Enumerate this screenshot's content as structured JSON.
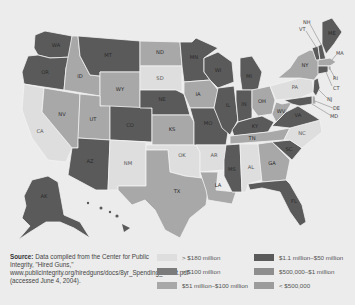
{
  "map": {
    "title": "",
    "colors": {
      "gt180": "#dedede",
      "gt100": "#7b7b7b",
      "m51_100": "#a8a8a8",
      "m1_50": "#5a5a5a",
      "k500_1m": "#8e8e8e",
      "lt500k": "#9c9c9c"
    },
    "states": [
      {
        "abbr": "WA",
        "category": "$1.1 million–$50 million"
      },
      {
        "abbr": "OR",
        "category": "$1.1 million–$50 million"
      },
      {
        "abbr": "CA",
        "category": "> $180 million"
      },
      {
        "abbr": "ID",
        "category": "$51 million–$100 million"
      },
      {
        "abbr": "NV",
        "category": "$51 million–$100 million"
      },
      {
        "abbr": "MT",
        "category": "$1.1 million–$50 million"
      },
      {
        "abbr": "WY",
        "category": "$51 million–$100 million"
      },
      {
        "abbr": "UT",
        "category": "$51 million–$100 million"
      },
      {
        "abbr": "AZ",
        "category": "$1.1 million–$50 million"
      },
      {
        "abbr": "CO",
        "category": "$1.1 million–$50 million"
      },
      {
        "abbr": "NM",
        "category": "> $180 million"
      },
      {
        "abbr": "ND",
        "category": "$51 million–$100 million"
      },
      {
        "abbr": "SD",
        "category": "> $180 million"
      },
      {
        "abbr": "NE",
        "category": "$1.1 million–$50 million"
      },
      {
        "abbr": "KS",
        "category": "$51 million–$100 million"
      },
      {
        "abbr": "OK",
        "category": "> $180 million"
      },
      {
        "abbr": "TX",
        "category": "$51 million–$100 million"
      },
      {
        "abbr": "MN",
        "category": "$1.1 million–$50 million"
      },
      {
        "abbr": "IA",
        "category": "$51 million–$100 million"
      },
      {
        "abbr": "MO",
        "category": "$1.1 million–$50 million"
      },
      {
        "abbr": "AR",
        "category": "> $180 million"
      },
      {
        "abbr": "LA",
        "category": "$51 million–$100 million"
      },
      {
        "abbr": "WI",
        "category": "$1.1 million–$50 million"
      },
      {
        "abbr": "IL",
        "category": "$1.1 million–$50 million"
      },
      {
        "abbr": "MI",
        "category": "$1.1 million–$50 million"
      },
      {
        "abbr": "IN",
        "category": "$1.1 million–$50 million"
      },
      {
        "abbr": "OH",
        "category": "$51 million–$100 million"
      },
      {
        "abbr": "KY",
        "category": "$1.1 million–$50 million"
      },
      {
        "abbr": "TN",
        "category": "$51 million–$100 million"
      },
      {
        "abbr": "MS",
        "category": "$1.1 million–$50 million"
      },
      {
        "abbr": "AL",
        "category": "> $180 million"
      },
      {
        "abbr": "GA",
        "category": "$51 million–$100 million"
      },
      {
        "abbr": "FL",
        "category": "$1.1 million–$50 million"
      },
      {
        "abbr": "SC",
        "category": "$1.1 million–$50 million"
      },
      {
        "abbr": "NC",
        "category": "> $180 million"
      },
      {
        "abbr": "VA",
        "category": "$1.1 million–$50 million"
      },
      {
        "abbr": "WV",
        "category": "$51 million–$100 million"
      },
      {
        "abbr": "PA",
        "category": "> $180 million"
      },
      {
        "abbr": "NY",
        "category": "$51 million–$100 million"
      },
      {
        "abbr": "VT",
        "category": "$1.1 million–$50 million"
      },
      {
        "abbr": "NH",
        "category": "$1.1 million–$50 million"
      },
      {
        "abbr": "ME",
        "category": "$1.1 million–$50 million"
      },
      {
        "abbr": "MA",
        "category": "$51 million–$100 million"
      },
      {
        "abbr": "RI",
        "category": "$51 million–$100 million"
      },
      {
        "abbr": "CT",
        "category": "$1.1 million–$50 million"
      },
      {
        "abbr": "NJ",
        "category": "$1.1 million–$50 million"
      },
      {
        "abbr": "DE",
        "category": "$51 million–$100 million"
      },
      {
        "abbr": "MD",
        "category": "$1.1 million–$50 million"
      },
      {
        "abbr": "AK",
        "category": "$1.1 million–$50 million"
      },
      {
        "abbr": "HI",
        "category": "$1.1 million–$50 million"
      }
    ],
    "labels": {
      "WA": "WA",
      "OR": "OR",
      "CA": "CA",
      "ID": "ID",
      "NV": "NV",
      "MT": "MT",
      "WY": "WY",
      "UT": "UT",
      "AZ": "AZ",
      "CO": "CO",
      "NM": "NM",
      "ND": "ND",
      "SD": "SD",
      "NE": "NE",
      "KS": "KS",
      "OK": "OK",
      "TX": "TX",
      "MN": "MN",
      "IA": "IA",
      "MO": "MO",
      "AR": "AR",
      "LA": "LA",
      "WI": "WI",
      "IL": "IL",
      "MI": "MI",
      "IN": "IN",
      "OH": "OH",
      "KY": "KY",
      "TN": "TN",
      "MS": "MS",
      "AL": "AL",
      "GA": "GA",
      "FL": "FL",
      "SC": "SC",
      "NC": "NC",
      "VA": "VA",
      "WV": "WV",
      "PA": "PA",
      "NY": "NY",
      "VT": "VT",
      "NH": "NH",
      "ME": "ME",
      "MA": "MA",
      "RI": "RI",
      "CT": "CT",
      "NJ": "NJ",
      "DE": "DE",
      "MD": "MD",
      "AK": "AK"
    }
  },
  "source": {
    "label": "Source:",
    "text": "Data compiled from the Center for Public Integrity, \"Hired Guns,\" www.publicintegrity.org/hiredguns/docs/8yr_Spending_Chart.pdf (accessed June 4, 2004)."
  },
  "legend": {
    "items": [
      {
        "label": "> $180 million",
        "color": "#dedede"
      },
      {
        "label": "> $100 million",
        "color": "#7b7b7b"
      },
      {
        "label": "$51 million–$100 million",
        "color": "#a8a8a8"
      },
      {
        "label": "$1.1 million–$50 million",
        "color": "#5a5a5a"
      },
      {
        "label": "$500,000–$1 million",
        "color": "#8e8e8e"
      },
      {
        "label": "< $500,000",
        "color": "#9c9c9c"
      }
    ]
  }
}
